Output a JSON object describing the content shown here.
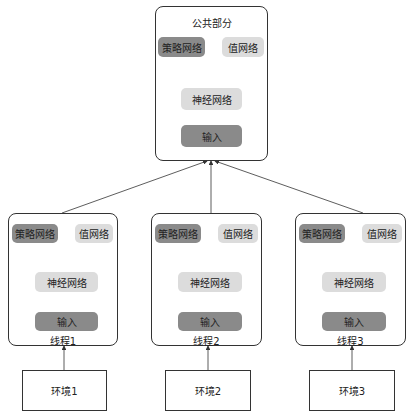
{
  "shared": {
    "title": "公共部分",
    "policy": "策略网络",
    "value": "值网络",
    "network": "神经网络",
    "input": "输入"
  },
  "threads": [
    {
      "label": "线程1",
      "policy": "策略网络",
      "value": "值网络",
      "network": "神经网络",
      "input": "输入"
    },
    {
      "label": "线程2",
      "policy": "策略网络",
      "value": "值网络",
      "network": "神经网络",
      "input": "输入"
    },
    {
      "label": "线程3",
      "policy": "策略网络",
      "value": "值网络",
      "network": "神经网络",
      "input": "输入"
    }
  ],
  "environments": [
    "环境1",
    "环境2",
    "环境3"
  ],
  "colors": {
    "dark_block": "#8a8a8a",
    "light_block": "#dcdcdc",
    "line": "#333333"
  }
}
